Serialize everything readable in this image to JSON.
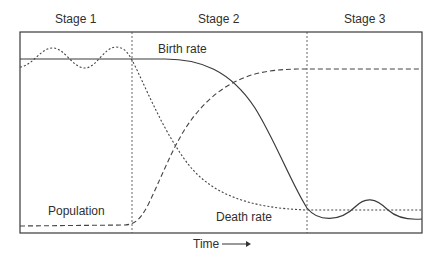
{
  "diagram": {
    "stages": [
      {
        "label": "Stage 1"
      },
      {
        "label": "Stage 2"
      },
      {
        "label": "Stage 3"
      }
    ],
    "curves": [
      {
        "label": "Birth rate",
        "style": "solid"
      },
      {
        "label": "Death rate",
        "style": "dotted"
      },
      {
        "label": "Population",
        "style": "dashed"
      }
    ],
    "x_axis": {
      "label": "Time",
      "arrow": "right-arrow"
    },
    "colors": {
      "line": "#3a3a3a",
      "frame": "#3a3a3a",
      "background": "#ffffff"
    }
  }
}
